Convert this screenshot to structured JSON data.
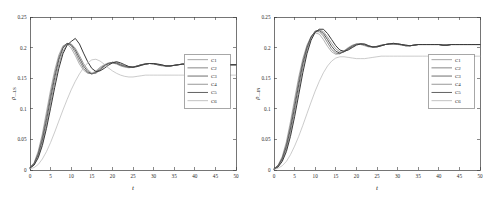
{
  "figure": {
    "background": "#ffffff",
    "panel_count": 2
  },
  "chart_data": [
    {
      "type": "line",
      "panel": "left",
      "title": "",
      "xlabel": "t",
      "ylabel": "ρ—LS",
      "ylabel_main": "ρ",
      "ylabel_sub": "—LS",
      "xlim": [
        0,
        50
      ],
      "ylim": [
        0,
        0.25
      ],
      "xticks": [
        0,
        5,
        10,
        15,
        20,
        25,
        30,
        35,
        40,
        45,
        50
      ],
      "xticklabels": [
        "0",
        "5",
        "10",
        "15",
        "20",
        "25",
        "30",
        "35",
        "40",
        "45",
        "50"
      ],
      "yticks": [
        0,
        0.05,
        0.1,
        0.15,
        0.2,
        0.25
      ],
      "yticklabels": [
        "0",
        "0.05",
        "0.1",
        "0.15",
        "0.2",
        "0.25"
      ],
      "grid": false,
      "legend_position": "center-right",
      "legend_entries": [
        "C1",
        "C2",
        "C3",
        "C4",
        "C5",
        "C6"
      ],
      "x": [
        0,
        1,
        2,
        3,
        4,
        5,
        6,
        7,
        8,
        9,
        10,
        11,
        12,
        13,
        14,
        15,
        16,
        17,
        18,
        19,
        20,
        21,
        22,
        23,
        24,
        25,
        26,
        27,
        28,
        29,
        30,
        31,
        32,
        33,
        34,
        35,
        36,
        37,
        38,
        39,
        40,
        41,
        42,
        43,
        44,
        45,
        46,
        47,
        48,
        49,
        50
      ],
      "series": [
        {
          "name": "C1",
          "color": "#8f8f8f",
          "width": 0.7,
          "values": [
            0.004,
            0.012,
            0.031,
            0.059,
            0.095,
            0.131,
            0.163,
            0.188,
            0.203,
            0.206,
            0.199,
            0.187,
            0.173,
            0.163,
            0.158,
            0.158,
            0.162,
            0.168,
            0.172,
            0.175,
            0.175,
            0.173,
            0.17,
            0.168,
            0.167,
            0.168,
            0.17,
            0.172,
            0.174,
            0.174,
            0.173,
            0.172,
            0.17,
            0.17,
            0.17,
            0.171,
            0.172,
            0.173,
            0.173,
            0.173,
            0.172,
            0.172,
            0.171,
            0.171,
            0.172,
            0.172,
            0.172,
            0.173,
            0.172,
            0.172,
            0.172
          ]
        },
        {
          "name": "C2",
          "color": "#6a6a6a",
          "width": 0.8,
          "values": [
            0.004,
            0.011,
            0.028,
            0.054,
            0.088,
            0.124,
            0.157,
            0.184,
            0.201,
            0.207,
            0.203,
            0.192,
            0.178,
            0.166,
            0.159,
            0.157,
            0.16,
            0.166,
            0.171,
            0.174,
            0.175,
            0.174,
            0.171,
            0.169,
            0.168,
            0.168,
            0.17,
            0.172,
            0.173,
            0.174,
            0.173,
            0.172,
            0.171,
            0.17,
            0.17,
            0.171,
            0.172,
            0.173,
            0.173,
            0.173,
            0.172,
            0.172,
            0.171,
            0.171,
            0.172,
            0.172,
            0.172,
            0.172,
            0.172,
            0.172,
            0.172
          ]
        },
        {
          "name": "C3",
          "color": "#4a4a4a",
          "width": 0.9,
          "values": [
            0.004,
            0.01,
            0.025,
            0.049,
            0.081,
            0.117,
            0.151,
            0.18,
            0.199,
            0.207,
            0.205,
            0.196,
            0.183,
            0.17,
            0.161,
            0.157,
            0.159,
            0.164,
            0.17,
            0.174,
            0.176,
            0.175,
            0.172,
            0.17,
            0.168,
            0.168,
            0.17,
            0.172,
            0.173,
            0.174,
            0.174,
            0.172,
            0.171,
            0.17,
            0.17,
            0.171,
            0.172,
            0.173,
            0.173,
            0.173,
            0.173,
            0.172,
            0.171,
            0.171,
            0.172,
            0.172,
            0.172,
            0.172,
            0.172,
            0.172,
            0.172
          ]
        },
        {
          "name": "C4",
          "color": "#7d7d7d",
          "width": 0.75,
          "values": [
            0.003,
            0.009,
            0.022,
            0.044,
            0.074,
            0.109,
            0.143,
            0.173,
            0.194,
            0.205,
            0.206,
            0.199,
            0.187,
            0.174,
            0.164,
            0.158,
            0.158,
            0.163,
            0.169,
            0.173,
            0.176,
            0.176,
            0.173,
            0.17,
            0.169,
            0.168,
            0.169,
            0.171,
            0.173,
            0.174,
            0.174,
            0.173,
            0.171,
            0.17,
            0.17,
            0.171,
            0.172,
            0.173,
            0.173,
            0.173,
            0.173,
            0.172,
            0.171,
            0.171,
            0.172,
            0.172,
            0.172,
            0.172,
            0.172,
            0.172,
            0.172
          ]
        },
        {
          "name": "C5",
          "color": "#3a3a3a",
          "width": 1.0,
          "values": [
            0.003,
            0.008,
            0.02,
            0.04,
            0.068,
            0.101,
            0.135,
            0.166,
            0.19,
            0.204,
            0.21,
            0.215,
            0.206,
            0.191,
            0.177,
            0.166,
            0.161,
            0.162,
            0.166,
            0.171,
            0.175,
            0.177,
            0.175,
            0.172,
            0.169,
            0.168,
            0.169,
            0.171,
            0.173,
            0.174,
            0.174,
            0.173,
            0.172,
            0.17,
            0.17,
            0.171,
            0.172,
            0.173,
            0.173,
            0.173,
            0.173,
            0.172,
            0.171,
            0.171,
            0.172,
            0.172,
            0.172,
            0.172,
            0.172,
            0.172,
            0.172
          ]
        },
        {
          "name": "C6",
          "color": "#b4b4b4",
          "width": 0.7,
          "values": [
            0.002,
            0.004,
            0.009,
            0.018,
            0.03,
            0.045,
            0.062,
            0.08,
            0.098,
            0.115,
            0.131,
            0.145,
            0.157,
            0.167,
            0.175,
            0.18,
            0.181,
            0.178,
            0.173,
            0.167,
            0.162,
            0.158,
            0.155,
            0.153,
            0.152,
            0.152,
            0.153,
            0.154,
            0.155,
            0.155,
            0.155,
            0.155,
            0.155,
            0.155,
            0.155,
            0.155,
            0.155,
            0.155,
            0.155,
            0.155,
            0.155,
            0.155,
            0.155,
            0.155,
            0.155,
            0.155,
            0.155,
            0.155,
            0.155,
            0.155,
            0.155
          ]
        }
      ]
    },
    {
      "type": "line",
      "panel": "right",
      "title": "",
      "xlabel": "t",
      "ylabel": "ρ—IN",
      "ylabel_main": "ρ",
      "ylabel_sub": "—IN",
      "xlim": [
        0,
        50
      ],
      "ylim": [
        0,
        0.25
      ],
      "xticks": [
        0,
        5,
        10,
        15,
        20,
        25,
        30,
        35,
        40,
        45,
        50
      ],
      "xticklabels": [
        "0",
        "5",
        "10",
        "15",
        "20",
        "25",
        "30",
        "35",
        "40",
        "45",
        "50"
      ],
      "yticks": [
        0,
        0.05,
        0.1,
        0.15,
        0.2,
        0.25
      ],
      "yticklabels": [
        "0",
        "0.05",
        "0.1",
        "0.15",
        "0.2",
        "0.25"
      ],
      "grid": false,
      "legend_position": "center-right",
      "legend_entries": [
        "C1",
        "C2",
        "C3",
        "C4",
        "C5",
        "C6"
      ],
      "x": [
        0,
        1,
        2,
        3,
        4,
        5,
        6,
        7,
        8,
        9,
        10,
        11,
        12,
        13,
        14,
        15,
        16,
        17,
        18,
        19,
        20,
        21,
        22,
        23,
        24,
        25,
        26,
        27,
        28,
        29,
        30,
        31,
        32,
        33,
        34,
        35,
        36,
        37,
        38,
        39,
        40,
        41,
        42,
        43,
        44,
        45,
        46,
        47,
        48,
        49,
        50
      ],
      "series": [
        {
          "name": "C1",
          "color": "#8f8f8f",
          "width": 0.7,
          "values": [
            0.002,
            0.008,
            0.022,
            0.046,
            0.079,
            0.116,
            0.152,
            0.182,
            0.204,
            0.218,
            0.224,
            0.222,
            0.213,
            0.202,
            0.193,
            0.189,
            0.19,
            0.195,
            0.2,
            0.204,
            0.206,
            0.205,
            0.203,
            0.201,
            0.201,
            0.202,
            0.204,
            0.205,
            0.206,
            0.206,
            0.205,
            0.204,
            0.203,
            0.203,
            0.204,
            0.205,
            0.205,
            0.205,
            0.205,
            0.205,
            0.205,
            0.204,
            0.204,
            0.205,
            0.205,
            0.205,
            0.205,
            0.205,
            0.205,
            0.205,
            0.205
          ]
        },
        {
          "name": "C2",
          "color": "#6a6a6a",
          "width": 0.8,
          "values": [
            0.002,
            0.007,
            0.02,
            0.042,
            0.073,
            0.109,
            0.146,
            0.178,
            0.202,
            0.218,
            0.226,
            0.226,
            0.219,
            0.208,
            0.197,
            0.191,
            0.19,
            0.194,
            0.199,
            0.203,
            0.206,
            0.206,
            0.204,
            0.202,
            0.201,
            0.202,
            0.204,
            0.205,
            0.206,
            0.206,
            0.206,
            0.204,
            0.203,
            0.203,
            0.204,
            0.205,
            0.205,
            0.205,
            0.205,
            0.205,
            0.205,
            0.204,
            0.204,
            0.205,
            0.205,
            0.205,
            0.205,
            0.205,
            0.205,
            0.205,
            0.205
          ]
        },
        {
          "name": "C3",
          "color": "#4a4a4a",
          "width": 0.95,
          "values": [
            0.002,
            0.007,
            0.018,
            0.038,
            0.067,
            0.102,
            0.139,
            0.173,
            0.199,
            0.217,
            0.227,
            0.228,
            0.223,
            0.213,
            0.202,
            0.194,
            0.191,
            0.193,
            0.198,
            0.202,
            0.205,
            0.206,
            0.205,
            0.202,
            0.201,
            0.202,
            0.203,
            0.205,
            0.206,
            0.206,
            0.206,
            0.205,
            0.203,
            0.203,
            0.204,
            0.205,
            0.205,
            0.205,
            0.205,
            0.205,
            0.205,
            0.204,
            0.204,
            0.205,
            0.205,
            0.205,
            0.205,
            0.205,
            0.205,
            0.205,
            0.205
          ]
        },
        {
          "name": "C4",
          "color": "#7d7d7d",
          "width": 0.75,
          "values": [
            0.002,
            0.006,
            0.016,
            0.034,
            0.061,
            0.095,
            0.131,
            0.167,
            0.195,
            0.215,
            0.226,
            0.229,
            0.226,
            0.217,
            0.207,
            0.198,
            0.193,
            0.193,
            0.197,
            0.201,
            0.205,
            0.206,
            0.205,
            0.203,
            0.201,
            0.201,
            0.203,
            0.205,
            0.206,
            0.207,
            0.206,
            0.205,
            0.204,
            0.203,
            0.204,
            0.205,
            0.205,
            0.205,
            0.205,
            0.205,
            0.205,
            0.204,
            0.204,
            0.205,
            0.205,
            0.205,
            0.205,
            0.205,
            0.205,
            0.205,
            0.205
          ]
        },
        {
          "name": "C5",
          "color": "#3a3a3a",
          "width": 1.0,
          "values": [
            0.001,
            0.005,
            0.014,
            0.03,
            0.055,
            0.087,
            0.123,
            0.159,
            0.19,
            0.212,
            0.225,
            0.23,
            0.23,
            0.223,
            0.213,
            0.203,
            0.196,
            0.194,
            0.196,
            0.2,
            0.204,
            0.206,
            0.206,
            0.203,
            0.201,
            0.201,
            0.203,
            0.205,
            0.206,
            0.207,
            0.206,
            0.205,
            0.204,
            0.203,
            0.204,
            0.205,
            0.205,
            0.205,
            0.205,
            0.205,
            0.205,
            0.204,
            0.204,
            0.205,
            0.205,
            0.205,
            0.205,
            0.205,
            0.205,
            0.205,
            0.205
          ]
        },
        {
          "name": "C6",
          "color": "#b4b4b4",
          "width": 0.7,
          "values": [
            0.001,
            0.003,
            0.007,
            0.014,
            0.025,
            0.039,
            0.055,
            0.073,
            0.092,
            0.111,
            0.129,
            0.145,
            0.159,
            0.17,
            0.178,
            0.183,
            0.185,
            0.185,
            0.184,
            0.183,
            0.182,
            0.182,
            0.182,
            0.183,
            0.184,
            0.185,
            0.186,
            0.186,
            0.186,
            0.186,
            0.186,
            0.186,
            0.186,
            0.186,
            0.186,
            0.186,
            0.186,
            0.186,
            0.186,
            0.186,
            0.186,
            0.186,
            0.186,
            0.186,
            0.186,
            0.186,
            0.186,
            0.186,
            0.186,
            0.186,
            0.186
          ]
        }
      ]
    }
  ]
}
